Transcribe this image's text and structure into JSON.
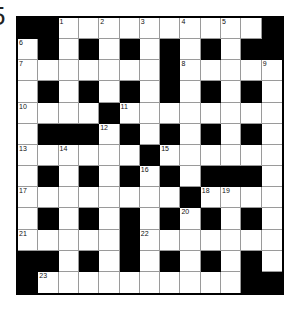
{
  "page": {
    "cropped_label": "5"
  },
  "crossword": {
    "rows": 13,
    "cols": 13,
    "colors": {
      "block": "#000000",
      "cell": "#ffffff",
      "grid_line": "#9a9a9a"
    },
    "grid": [
      [
        "#",
        "#",
        "1",
        "",
        "2",
        "",
        "3",
        "",
        "4",
        "",
        "5",
        "",
        "#"
      ],
      [
        "6",
        "#",
        "",
        "#",
        "",
        "#",
        "",
        "#",
        "",
        "#",
        "",
        "#",
        "#"
      ],
      [
        "7",
        "",
        "",
        "",
        "",
        "",
        "",
        "#",
        "8",
        "",
        "",
        "",
        "9"
      ],
      [
        "",
        "#",
        "",
        "#",
        "",
        "#",
        "",
        "#",
        "",
        "#",
        "",
        "#",
        ""
      ],
      [
        "10",
        "",
        "",
        "",
        "#",
        "11",
        "",
        "",
        "",
        "",
        "",
        "",
        ""
      ],
      [
        "",
        "#",
        "#",
        "#",
        "12",
        "#",
        "",
        "#",
        "",
        "#",
        "",
        "#",
        ""
      ],
      [
        "13",
        "",
        "14",
        "",
        "",
        "",
        "#",
        "15",
        "",
        "",
        "",
        "",
        ""
      ],
      [
        "",
        "#",
        "",
        "#",
        "",
        "#",
        "16",
        "#",
        "",
        "#",
        "#",
        "#",
        ""
      ],
      [
        "17",
        "",
        "",
        "",
        "",
        "",
        "",
        "",
        "#",
        "18",
        "19",
        "",
        ""
      ],
      [
        "",
        "#",
        "",
        "#",
        "",
        "#",
        "",
        "#",
        "20",
        "#",
        "",
        "#",
        ""
      ],
      [
        "21",
        "",
        "",
        "",
        "",
        "#",
        "22",
        "",
        "",
        "",
        "",
        "",
        ""
      ],
      [
        "#",
        "#",
        "",
        "#",
        "",
        "#",
        "",
        "#",
        "",
        "#",
        "",
        "#",
        ""
      ],
      [
        "#",
        "23",
        "",
        "",
        "",
        "",
        "",
        "",
        "",
        "",
        "",
        "#",
        "#"
      ]
    ]
  }
}
